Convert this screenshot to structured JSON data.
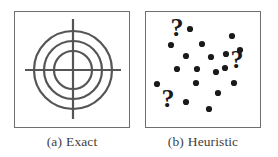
{
  "figure": {
    "background_color": "#ffffff",
    "ink_color": "#3f3f3f",
    "panel_border_color": "#6e6e6e",
    "panels": [
      {
        "id": "panel-a",
        "caption_label": "(a)",
        "caption_text": "Exact",
        "graphic": "bullseye-target",
        "description": "Concentric circles with crosshair",
        "stroke_color": "#555555",
        "stroke_width": 2.2,
        "center": {
          "x": 58,
          "y": 58
        },
        "circle_radii": [
          19,
          29,
          39
        ],
        "crosshair": {
          "horizontal": {
            "x1": 10,
            "x2": 106,
            "y": 58
          },
          "vertical": {
            "y1": 7,
            "y2": 107,
            "x": 58
          }
        }
      },
      {
        "id": "panel-b",
        "caption_label": "(b)",
        "caption_text": "Heuristic",
        "graphic": "scattered-dots-and-question-marks",
        "description": "Randomly scattered filled dots with question mark glyphs",
        "dot_color": "#1a1a1a",
        "dot_radius": 3.1,
        "dot_count": 18,
        "dots": [
          {
            "x": 44,
            "y": 17
          },
          {
            "x": 86,
            "y": 24
          },
          {
            "x": 25,
            "y": 33
          },
          {
            "x": 56,
            "y": 32
          },
          {
            "x": 40,
            "y": 44
          },
          {
            "x": 65,
            "y": 45
          },
          {
            "x": 80,
            "y": 42
          },
          {
            "x": 31,
            "y": 57
          },
          {
            "x": 51,
            "y": 57
          },
          {
            "x": 70,
            "y": 60
          },
          {
            "x": 79,
            "y": 56
          },
          {
            "x": 11,
            "y": 72
          },
          {
            "x": 50,
            "y": 71
          },
          {
            "x": 88,
            "y": 71
          },
          {
            "x": 72,
            "y": 81
          },
          {
            "x": 40,
            "y": 90
          },
          {
            "x": 63,
            "y": 97
          },
          {
            "x": 94,
            "y": 38
          }
        ],
        "question_marks": [
          {
            "x": 31,
            "y": 24,
            "size": 26
          },
          {
            "x": 91,
            "y": 56,
            "size": 26
          },
          {
            "x": 22,
            "y": 95,
            "size": 26
          }
        ],
        "question_mark_glyph": "?"
      }
    ]
  }
}
